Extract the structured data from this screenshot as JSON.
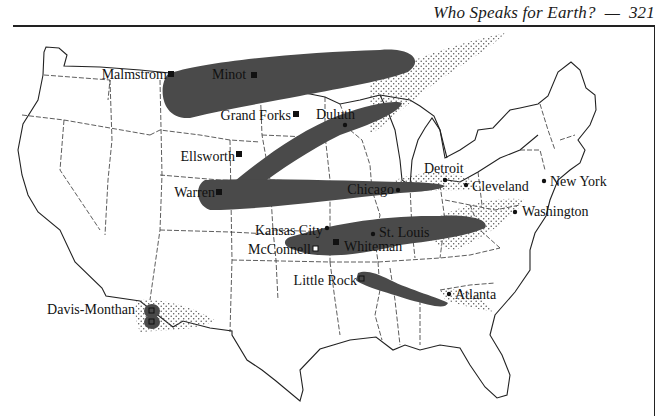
{
  "page": {
    "running_head": "Who Speaks for Earth?",
    "separator": "—",
    "page_number": "321"
  },
  "map": {
    "title": "United States map showing missile bases, cities, and fallout plumes",
    "colors": {
      "plume_fill": "#4a4a4a",
      "stipple": "#555555",
      "outline": "#222222",
      "background": "#ffffff"
    },
    "missile_bases": [
      {
        "name": "Malmstrom",
        "marker": "filled-square"
      },
      {
        "name": "Minot",
        "marker": "filled-square"
      },
      {
        "name": "Grand Forks",
        "marker": "filled-square"
      },
      {
        "name": "Ellsworth",
        "marker": "filled-square"
      },
      {
        "name": "Warren",
        "marker": "filled-square"
      },
      {
        "name": "Whiteman",
        "marker": "filled-square"
      },
      {
        "name": "McConnell",
        "marker": "open-square"
      },
      {
        "name": "Little Rock",
        "marker": "open-square"
      },
      {
        "name": "Davis-Monthan",
        "marker": "open-square"
      }
    ],
    "cities": [
      {
        "name": "Duluth",
        "marker": "dot"
      },
      {
        "name": "Detroit",
        "marker": "dot"
      },
      {
        "name": "Chicago",
        "marker": "dot"
      },
      {
        "name": "Cleveland",
        "marker": "dot"
      },
      {
        "name": "New York",
        "marker": "dot"
      },
      {
        "name": "Washington",
        "marker": "dot"
      },
      {
        "name": "Kansas City",
        "marker": "dot"
      },
      {
        "name": "St. Louis",
        "marker": "dot"
      },
      {
        "name": "Atlanta",
        "marker": "dot"
      }
    ],
    "legend_types": {
      "dark_plume": "heavy fallout",
      "stipple": "light fallout"
    }
  }
}
